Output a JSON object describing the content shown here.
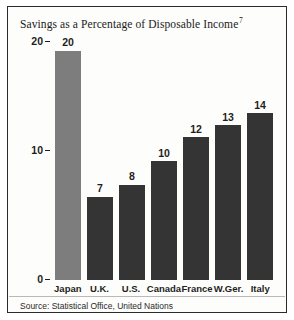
{
  "chart_data": {
    "type": "bar",
    "title": "Savings as a Percentage of Disposable Income",
    "title_superscript": "7",
    "categories": [
      "Japan",
      "U.K.",
      "U.S.",
      "Canada",
      "France",
      "W.Ger.",
      "Italy"
    ],
    "values": [
      20,
      7,
      8,
      10,
      12,
      13,
      14
    ],
    "value_labels": [
      "20",
      "7",
      "8",
      "10",
      "12",
      "13",
      "14"
    ],
    "xlabel": "",
    "ylabel": "",
    "ylim": [
      0,
      22
    ],
    "yticks": [
      0,
      10,
      20
    ],
    "ytick_labels": [
      "0",
      "10",
      "20"
    ],
    "grid": false,
    "legend": false,
    "highlight_index": 0,
    "bar_color": "#343434",
    "highlight_color": "#7d7d7d",
    "source": "Source: Statistical Office, United Nations"
  }
}
